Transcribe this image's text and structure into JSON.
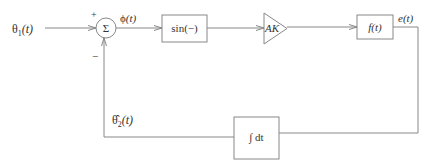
{
  "diagram": {
    "type": "block-diagram",
    "input": {
      "symbol": "θ",
      "subscript": "1",
      "arg": "(t)"
    },
    "summer": {
      "symbol": "Σ",
      "plus_sign": "+",
      "minus_sign": "−"
    },
    "phase_error": {
      "symbol": "ϕ",
      "arg": "(t)"
    },
    "blocks": {
      "nonlinearity": {
        "label": "sin(−)"
      },
      "gain": {
        "label": "AK"
      },
      "filter": {
        "label": "f(t)"
      },
      "integrator": {
        "label": "∫ dt"
      }
    },
    "filter_output": {
      "label": "e(t)"
    },
    "feedback": {
      "symbol": "θ̂",
      "subscript": "2",
      "arg": "(t)"
    },
    "colors": {
      "line": "#888888",
      "text": "#333333",
      "background": "#ffffff"
    }
  }
}
